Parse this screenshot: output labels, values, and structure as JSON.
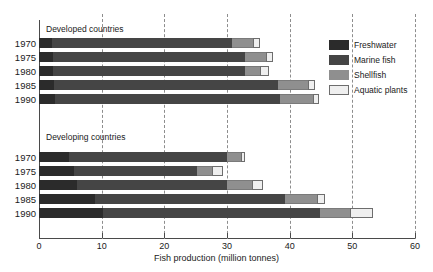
{
  "chart_data": {
    "type": "bar",
    "orientation": "horizontal",
    "stacked": true,
    "title": "",
    "xlabel": "Fish production (million tonnes)",
    "ylabel": "",
    "xlim": [
      0,
      60
    ],
    "xticks": [
      0,
      10,
      20,
      30,
      40,
      50,
      60
    ],
    "xticklabels": [
      "0",
      "10",
      "20",
      "30",
      "40",
      "50",
      "60"
    ],
    "grid": "vertical-dashed",
    "legend_position": "right",
    "series": [
      {
        "name": "Freshwater",
        "color": "#2b2b2b"
      },
      {
        "name": "Marine fish",
        "color": "#454545"
      },
      {
        "name": "Shellfish",
        "color": "#8f8f8f"
      },
      {
        "name": "Aquatic plants",
        "color": "#efefef"
      }
    ],
    "groups": [
      {
        "label": "Developed countries",
        "categories": [
          "1970",
          "1975",
          "1980",
          "1985",
          "1990"
        ],
        "values": {
          "Freshwater": [
            2.0,
            2.2,
            2.3,
            2.4,
            2.6
          ],
          "Marine fish": [
            28.8,
            30.6,
            30.5,
            35.7,
            35.8
          ],
          "Shellfish": [
            3.3,
            3.5,
            2.4,
            4.8,
            5.3
          ],
          "Aquatic plants": [
            1.1,
            1.0,
            1.5,
            1.1,
            1.0
          ]
        },
        "totals": [
          35.2,
          37.3,
          36.7,
          44.0,
          44.7
        ]
      },
      {
        "label": "Developing countries",
        "categories": [
          "1970",
          "1975",
          "1980",
          "1985",
          "1990"
        ],
        "values": {
          "Freshwater": [
            4.8,
            5.6,
            6.1,
            8.9,
            10.2
          ],
          "Marine fish": [
            25.2,
            19.6,
            23.9,
            30.3,
            34.6
          ],
          "Shellfish": [
            2.2,
            2.4,
            4.0,
            5.1,
            4.8
          ],
          "Aquatic plants": [
            0.7,
            1.8,
            1.8,
            1.4,
            3.7
          ]
        },
        "totals": [
          32.9,
          29.4,
          35.8,
          45.7,
          53.3
        ]
      }
    ]
  },
  "legend": {
    "items": [
      {
        "label": "Freshwater"
      },
      {
        "label": "Marine fish"
      },
      {
        "label": "Shellfish"
      },
      {
        "label": "Aquatic plants"
      }
    ]
  }
}
